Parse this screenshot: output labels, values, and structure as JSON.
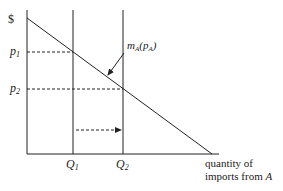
{
  "diagram": {
    "type": "import-demand",
    "y_axis_label": "$",
    "x_axis_label_lines": [
      "quantity of",
      "imports from "
    ],
    "x_axis_label_italic": "A",
    "price_labels": [
      {
        "base": "p",
        "sub": "1"
      },
      {
        "base": "p",
        "sub": "2"
      }
    ],
    "quantity_labels": [
      {
        "base": "Q",
        "sub": "1"
      },
      {
        "base": "Q",
        "sub": "2"
      }
    ],
    "curve_label": {
      "base": "m",
      "sub": "A",
      "arg_base": "p",
      "arg_sub": "A"
    },
    "shift_arrow": {
      "from": "Q1",
      "to": "Q2",
      "style": "dashed"
    },
    "colors": {
      "line": "#222222",
      "background": "#ffffff"
    }
  }
}
